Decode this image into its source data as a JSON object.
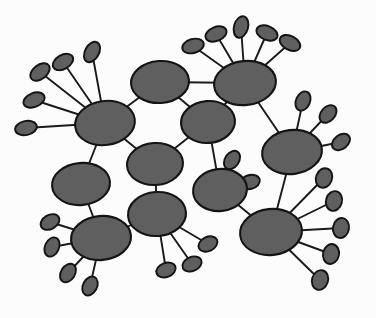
{
  "figure": {
    "kind": "network-graph",
    "width": 376,
    "height": 318,
    "background_color": "#fcfcfc"
  },
  "style": {
    "node_fill": "#5f5f5f",
    "node_stroke": "#141414",
    "node_stroke_width": 2.1,
    "edge_color": "#1a1a1a",
    "edge_width": 1.9,
    "leaf_stroke_width": 1.9
  },
  "chart_data": {
    "type": "graph",
    "node_count": 56,
    "hub_count": 11,
    "leaf_count": 45,
    "edge_count": 58,
    "hubs": [
      {
        "id": "h1",
        "label": "hub-upper-left",
        "cx": 105,
        "cy": 123,
        "rx": 30,
        "ry": 22,
        "rot": -8
      },
      {
        "id": "h2",
        "label": "hub-top-center",
        "cx": 160,
        "cy": 82,
        "rx": 29,
        "ry": 21,
        "rot": -4
      },
      {
        "id": "h3",
        "label": "hub-top-right",
        "cx": 245,
        "cy": 83,
        "rx": 31,
        "ry": 22,
        "rot": -6
      },
      {
        "id": "h4",
        "label": "hub-center",
        "cx": 208,
        "cy": 122,
        "rx": 27,
        "ry": 21,
        "rot": -5
      },
      {
        "id": "h5",
        "label": "hub-mid-left",
        "cx": 155,
        "cy": 164,
        "rx": 28,
        "ry": 21,
        "rot": -4
      },
      {
        "id": "h6",
        "label": "hub-left-lower",
        "cx": 81,
        "cy": 184,
        "rx": 29,
        "ry": 21,
        "rot": -5
      },
      {
        "id": "h7",
        "label": "hub-bottom-left",
        "cx": 101,
        "cy": 238,
        "rx": 30,
        "ry": 22,
        "rot": -5
      },
      {
        "id": "h8",
        "label": "hub-bottom-center",
        "cx": 157,
        "cy": 214,
        "rx": 29,
        "ry": 22,
        "rot": -4
      },
      {
        "id": "h9",
        "label": "hub-mid-right",
        "cx": 220,
        "cy": 190,
        "rx": 27,
        "ry": 21,
        "rot": -6
      },
      {
        "id": "h10",
        "label": "hub-right",
        "cx": 292,
        "cy": 152,
        "rx": 30,
        "ry": 22,
        "rot": -7
      },
      {
        "id": "h11",
        "label": "hub-bottom-right",
        "cx": 271,
        "cy": 232,
        "rx": 31,
        "ry": 23,
        "rot": -6
      }
    ],
    "backbone_edges": [
      [
        "h1",
        "h2"
      ],
      [
        "h2",
        "h4"
      ],
      [
        "h3",
        "h4"
      ],
      [
        "h1",
        "h5"
      ],
      [
        "h4",
        "h5"
      ],
      [
        "h1",
        "h6"
      ],
      [
        "h5",
        "h8"
      ],
      [
        "h6",
        "h7"
      ],
      [
        "h7",
        "h8"
      ],
      [
        "h4",
        "h9"
      ],
      [
        "h3",
        "h10"
      ],
      [
        "h9",
        "h11"
      ],
      [
        "h10",
        "h11"
      ],
      [
        "h2",
        "h3"
      ]
    ],
    "leaves": [
      {
        "id": "l1",
        "parent": "h1",
        "cx": 40,
        "cy": 72,
        "rx": 11,
        "ry": 7,
        "rot": -38
      },
      {
        "id": "l2",
        "parent": "h1",
        "cx": 63,
        "cy": 62,
        "rx": 11,
        "ry": 7,
        "rot": -30
      },
      {
        "id": "l3",
        "parent": "h1",
        "cx": 92,
        "cy": 52,
        "rx": 11,
        "ry": 7,
        "rot": -62
      },
      {
        "id": "l4",
        "parent": "h1",
        "cx": 34,
        "cy": 100,
        "rx": 11,
        "ry": 7,
        "rot": -22
      },
      {
        "id": "l5",
        "parent": "h1",
        "cx": 26,
        "cy": 128,
        "rx": 11,
        "ry": 7,
        "rot": -12
      },
      {
        "id": "l6",
        "parent": "h3",
        "cx": 193,
        "cy": 46,
        "rx": 11,
        "ry": 7,
        "rot": -16
      },
      {
        "id": "l7",
        "parent": "h3",
        "cx": 216,
        "cy": 34,
        "rx": 11,
        "ry": 7,
        "rot": -22
      },
      {
        "id": "l8",
        "parent": "h3",
        "cx": 241,
        "cy": 27,
        "rx": 11,
        "ry": 7,
        "rot": -74
      },
      {
        "id": "l9",
        "parent": "h3",
        "cx": 267,
        "cy": 33,
        "rx": 11,
        "ry": 7,
        "rot": 22
      },
      {
        "id": "l10",
        "parent": "h3",
        "cx": 290,
        "cy": 43,
        "rx": 11,
        "ry": 7,
        "rot": 28
      },
      {
        "id": "l11",
        "parent": "h9",
        "cx": 232,
        "cy": 160,
        "rx": 10,
        "ry": 7,
        "rot": -56
      },
      {
        "id": "l12",
        "parent": "h9",
        "cx": 250,
        "cy": 182,
        "rx": 10,
        "ry": 7,
        "rot": -14
      },
      {
        "id": "l13",
        "parent": "h10",
        "cx": 303,
        "cy": 101,
        "rx": 10,
        "ry": 7,
        "rot": -66
      },
      {
        "id": "l14",
        "parent": "h10",
        "cx": 328,
        "cy": 114,
        "rx": 10,
        "ry": 7,
        "rot": -48
      },
      {
        "id": "l15",
        "parent": "h10",
        "cx": 341,
        "cy": 142,
        "rx": 10,
        "ry": 7,
        "rot": -38
      },
      {
        "id": "l16",
        "parent": "h7",
        "cx": 50,
        "cy": 222,
        "rx": 10,
        "ry": 7,
        "rot": -30
      },
      {
        "id": "l17",
        "parent": "h7",
        "cx": 52,
        "cy": 247,
        "rx": 10,
        "ry": 7,
        "rot": -66
      },
      {
        "id": "l18",
        "parent": "h7",
        "cx": 68,
        "cy": 273,
        "rx": 10,
        "ry": 7,
        "rot": -58
      },
      {
        "id": "l19",
        "parent": "h7",
        "cx": 90,
        "cy": 286,
        "rx": 10,
        "ry": 7,
        "rot": -62
      },
      {
        "id": "l20",
        "parent": "h8",
        "cx": 166,
        "cy": 270,
        "rx": 10,
        "ry": 7,
        "rot": -20
      },
      {
        "id": "l21",
        "parent": "h8",
        "cx": 192,
        "cy": 264,
        "rx": 10,
        "ry": 7,
        "rot": -24
      },
      {
        "id": "l22",
        "parent": "h8",
        "cx": 208,
        "cy": 244,
        "rx": 10,
        "ry": 7,
        "rot": -26
      },
      {
        "id": "l23",
        "parent": "h11",
        "cx": 324,
        "cy": 178,
        "rx": 10,
        "ry": 8,
        "rot": -70
      },
      {
        "id": "l24",
        "parent": "h11",
        "cx": 334,
        "cy": 201,
        "rx": 10,
        "ry": 8,
        "rot": -74
      },
      {
        "id": "l25",
        "parent": "h11",
        "cx": 341,
        "cy": 228,
        "rx": 10,
        "ry": 8,
        "rot": -80
      },
      {
        "id": "l26",
        "parent": "h11",
        "cx": 331,
        "cy": 254,
        "rx": 10,
        "ry": 8,
        "rot": -78
      },
      {
        "id": "l27",
        "parent": "h11",
        "cx": 320,
        "cy": 280,
        "rx": 10,
        "ry": 8,
        "rot": -72
      }
    ]
  }
}
